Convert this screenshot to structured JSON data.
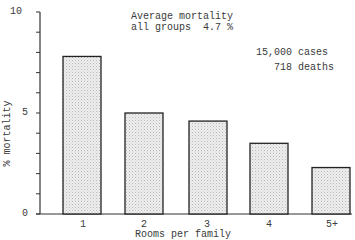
{
  "chart_data": {
    "type": "bar",
    "annotation_lines": [
      "Average mortality",
      "all groups  4.7 %"
    ],
    "side_note": [
      "15,000 cases",
      "718 deaths"
    ],
    "categories": [
      "1",
      "2",
      "3",
      "4",
      "5+"
    ],
    "values": [
      7.8,
      5.0,
      4.6,
      3.5,
      2.3
    ],
    "xlabel": "Rooms per family",
    "ylabel": "% mortality",
    "ylim": [
      0,
      10
    ],
    "yticks_labeled": [
      "0",
      "5",
      "10"
    ],
    "ytick_step": 1,
    "grid": false,
    "legend": null,
    "bar_fill": "stippled light gray",
    "colors": {
      "bar_fill": "#e6e6e6",
      "bar_stroke": "#222222",
      "axis": "#333333",
      "text": "#3a3a3a"
    }
  }
}
